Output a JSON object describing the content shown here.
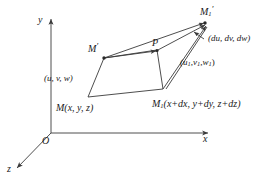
{
  "figure": {
    "type": "vector-field-diagram",
    "axes": {
      "y_label": "y",
      "x_label": "x",
      "z_label": "z",
      "origin_label": "O"
    },
    "points": {
      "M": "M",
      "M_coords": "(x, y, z)",
      "M1": "M",
      "M1_sub": "1",
      "M1_coords": "(x+dx, y+dy, z+dz)",
      "M_prime": "M",
      "M1_prime": "M",
      "M1_prime_sub": "1",
      "P": "P"
    },
    "vectors": {
      "uvw": "(u, v, w)",
      "u1v1w1_open": "(",
      "u1v1w1_u": "u",
      "u1v1w1_sub1": "1",
      "u1v1w1_v": "v",
      "u1v1w1_sub2": "1",
      "u1v1w1_w": "w",
      "u1v1w1_sub3": "1",
      "dudvdw": "(du, dv, dw)"
    },
    "colors": {
      "stroke": "#3a3a3a",
      "text": "#1a1a1a",
      "background": "#ffffff"
    }
  }
}
